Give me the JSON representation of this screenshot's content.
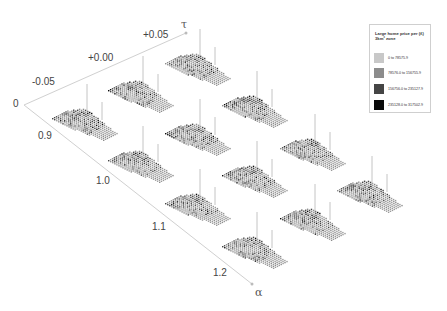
{
  "chart_data": {
    "type": "heatmap",
    "axes": {
      "tau": {
        "title": "τ",
        "ticks": [
          "-0.05",
          "+0.00",
          "+0.05"
        ]
      },
      "alpha": {
        "title": "α",
        "ticks": [
          "0.9",
          "1.0",
          "1.1",
          "1.2"
        ]
      },
      "origin_label": "0"
    },
    "legend": {
      "title": "Large home price per (£) 3km² zone",
      "position": "top-right",
      "entries": [
        {
          "label": "0 to 78575.9",
          "color": "#c8c8c8"
        },
        {
          "label": "78576.0 to 156755.9",
          "color": "#8c8c8c"
        },
        {
          "label": "156756.0 to 235127.9",
          "color": "#454545"
        },
        {
          "label": "235128.0 to 317502.9",
          "color": "#0a0a0a"
        }
      ]
    },
    "panels": [
      {
        "alpha": "0.9",
        "tau": "-0.05",
        "x": 52,
        "y": 118
      },
      {
        "alpha": "0.9",
        "tau": "+0.00",
        "x": 108,
        "y": 90
      },
      {
        "alpha": "0.9",
        "tau": "+0.05",
        "x": 165,
        "y": 63
      },
      {
        "alpha": "1.0",
        "tau": "-0.05",
        "x": 108,
        "y": 160
      },
      {
        "alpha": "1.0",
        "tau": "+0.00",
        "x": 165,
        "y": 133
      },
      {
        "alpha": "1.0",
        "tau": "+0.05",
        "x": 222,
        "y": 105
      },
      {
        "alpha": "1.1",
        "tau": "-0.05",
        "x": 165,
        "y": 203
      },
      {
        "alpha": "1.1",
        "tau": "+0.00",
        "x": 222,
        "y": 175
      },
      {
        "alpha": "1.1",
        "tau": "+0.05",
        "x": 280,
        "y": 148
      },
      {
        "alpha": "1.2",
        "tau": "-0.05",
        "x": 222,
        "y": 246
      },
      {
        "alpha": "1.2",
        "tau": "+0.00",
        "x": 280,
        "y": 218
      },
      {
        "alpha": "1.2",
        "tau": "+0.05",
        "x": 337,
        "y": 190
      }
    ],
    "grid": false
  },
  "labels": {
    "tau_title": "τ",
    "alpha_title": "α",
    "origin": "0",
    "tau_ticks": [
      "-0.05",
      "+0.00",
      "+0.05"
    ],
    "alpha_ticks": [
      "0.9",
      "1.0",
      "1.1",
      "1.2"
    ]
  }
}
